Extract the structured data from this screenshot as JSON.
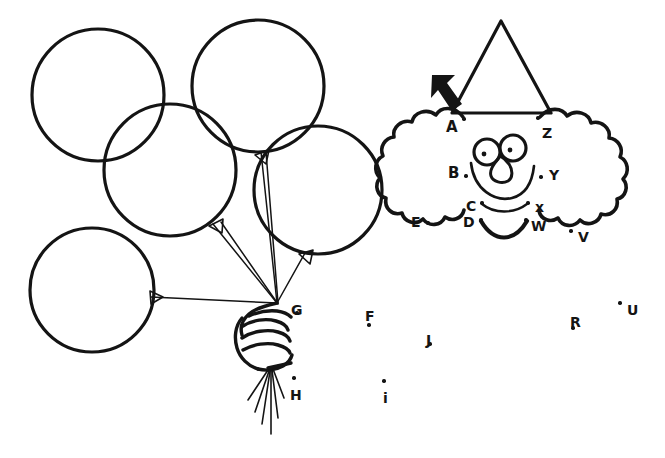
{
  "page": {
    "background_color": "#ffffff",
    "ink_color": "#141414",
    "width": 665,
    "height": 458
  },
  "artwork": {
    "balloons": {
      "count": 5,
      "description": "bunch of five round balloons with strings",
      "circles": [
        {
          "name": "balloon-top-left",
          "cx": 98,
          "cy": 95,
          "r": 66
        },
        {
          "name": "balloon-top-right",
          "cx": 258,
          "cy": 86,
          "r": 66
        },
        {
          "name": "balloon-middle",
          "cx": 170,
          "cy": 170,
          "r": 66
        },
        {
          "name": "balloon-right",
          "cx": 318,
          "cy": 190,
          "r": 64
        },
        {
          "name": "balloon-bottom-left",
          "cx": 92,
          "cy": 290,
          "r": 62
        }
      ],
      "strings_knot": {
        "x": 277,
        "y": 303
      },
      "arrowheads": 4
    },
    "hand": {
      "name": "fist-holding-strings",
      "description": "clenched fist gripping the balloon strings",
      "loose_string_ends": 6
    },
    "clown": {
      "hat": {
        "name": "party-hat",
        "shape": "triangle"
      },
      "hair_left": {
        "name": "hair-left",
        "shape": "scalloped-cloud"
      },
      "hair_right": {
        "name": "hair-right",
        "shape": "scalloped-cloud"
      },
      "eyes": 2,
      "nose": {
        "shape": "teardrop"
      },
      "smile": {
        "shape": "arc"
      },
      "collar_arc_thin": {
        "from": "C",
        "to": "x"
      },
      "collar_arc_thick": {
        "from": "D",
        "to": "W"
      }
    },
    "pointer_arrow": {
      "name": "start-here-arrow",
      "points_to": "A",
      "direction": "down-right"
    }
  },
  "dots": [
    {
      "label": "A",
      "letter_x": 446,
      "letter_y": 120,
      "dot_x": 464,
      "dot_y": 119,
      "size": "sz-lg"
    },
    {
      "label": "B",
      "letter_x": 448,
      "letter_y": 166,
      "dot_x": 466,
      "dot_y": 176,
      "size": "sz-lg"
    },
    {
      "label": "C",
      "letter_x": 466,
      "letter_y": 199,
      "dot_x": 482,
      "dot_y": 203,
      "size": "sz-md"
    },
    {
      "label": "D",
      "letter_x": 463,
      "letter_y": 215,
      "dot_x": 481,
      "dot_y": 220,
      "size": "sz-md"
    },
    {
      "label": "E",
      "letter_x": 411,
      "letter_y": 215,
      "dot_x": 428,
      "dot_y": 223,
      "size": "sz-md"
    },
    {
      "label": "F",
      "letter_x": 365,
      "letter_y": 309,
      "dot_x": 369,
      "dot_y": 325,
      "size": "sz-md"
    },
    {
      "label": "G",
      "letter_x": 291,
      "letter_y": 303,
      "dot_x": 297,
      "dot_y": 313,
      "size": "sz-md"
    },
    {
      "label": "H",
      "letter_x": 290,
      "letter_y": 388,
      "dot_x": 294,
      "dot_y": 378,
      "size": "sz-md"
    },
    {
      "label": "i",
      "letter_x": 383,
      "letter_y": 391,
      "dot_x": 384,
      "dot_y": 381,
      "size": "sz-md"
    },
    {
      "label": "J",
      "letter_x": 426,
      "letter_y": 333,
      "dot_x": 430,
      "dot_y": 344,
      "size": "sz-md"
    },
    {
      "label": "R",
      "letter_x": 570,
      "letter_y": 315,
      "dot_x": 573,
      "dot_y": 328,
      "size": "sz-md"
    },
    {
      "label": "U",
      "letter_x": 627,
      "letter_y": 303,
      "dot_x": 620,
      "dot_y": 303,
      "size": "sz-md"
    },
    {
      "label": "V",
      "letter_x": 578,
      "letter_y": 230,
      "dot_x": 571,
      "dot_y": 231,
      "size": "sz-md"
    },
    {
      "label": "W",
      "letter_x": 531,
      "letter_y": 219,
      "dot_x": 526,
      "dot_y": 220,
      "size": "sz-md"
    },
    {
      "label": "x",
      "letter_x": 535,
      "letter_y": 200,
      "dot_x": 528,
      "dot_y": 203,
      "size": "sz-md"
    },
    {
      "label": "Y",
      "letter_x": 549,
      "letter_y": 168,
      "dot_x": 541,
      "dot_y": 177,
      "size": "sz-md"
    },
    {
      "label": "Z",
      "letter_x": 542,
      "letter_y": 126,
      "dot_x": 538,
      "dot_y": 118,
      "size": "sz-md"
    }
  ]
}
